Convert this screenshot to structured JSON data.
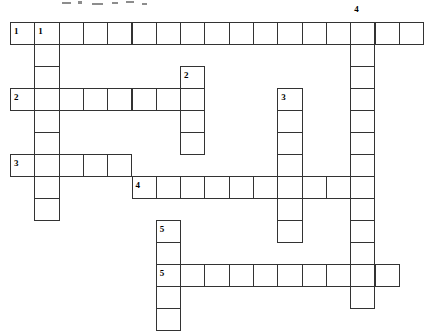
{
  "document": {
    "type": "crossword-puzzle-grid",
    "title": "Crossword Puzzle",
    "background_color": "#ffffff",
    "line_color": "#333333",
    "number_color": "#000000"
  },
  "grid": {
    "origin_x": 10,
    "origin_y": 22,
    "cell_width": 24.3,
    "cell_height": 22,
    "columns": 17,
    "rows": 14,
    "border_width": 1
  },
  "entries": [
    {
      "number": "1",
      "direction": "across",
      "row": 0,
      "col": 0,
      "length": 17,
      "label": "1-across"
    },
    {
      "number": "1",
      "direction": "down",
      "row": 0,
      "col": 1,
      "length": 9,
      "label": "1-down"
    },
    {
      "number": "2",
      "direction": "down",
      "row": 2,
      "col": 7,
      "length": 4,
      "label": "2-down"
    },
    {
      "number": "2",
      "direction": "across",
      "row": 3,
      "col": 0,
      "length": 8,
      "label": "2-across"
    },
    {
      "number": "3",
      "direction": "down",
      "row": 3,
      "col": 11,
      "length": 7,
      "label": "3-down"
    },
    {
      "number": "3",
      "direction": "across",
      "row": 6,
      "col": 0,
      "length": 5,
      "label": "3-across"
    },
    {
      "number": "4",
      "direction": "down",
      "row": 0,
      "col": 14,
      "length": 13,
      "label": "4-down"
    },
    {
      "number": "4",
      "direction": "across",
      "row": 7,
      "col": 5,
      "length": 10,
      "label": "4-across"
    },
    {
      "number": "5",
      "direction": "down",
      "row": 9,
      "col": 6,
      "length": 5,
      "label": "5-down"
    },
    {
      "number": "5",
      "direction": "across",
      "row": 11,
      "col": 6,
      "length": 10,
      "label": "5-across"
    }
  ],
  "numbered_cells": [
    {
      "number": "1",
      "row": 0,
      "col": 0
    },
    {
      "number": "1",
      "row": 0,
      "col": 1
    },
    {
      "number": "4",
      "row": -1,
      "col": 14
    },
    {
      "number": "2",
      "row": 2,
      "col": 7
    },
    {
      "number": "2",
      "row": 3,
      "col": 0
    },
    {
      "number": "3",
      "row": 3,
      "col": 11
    },
    {
      "number": "3",
      "row": 6,
      "col": 0
    },
    {
      "number": "4",
      "row": 7,
      "col": 5
    },
    {
      "number": "5",
      "row": 9,
      "col": 6
    },
    {
      "number": "5",
      "row": 11,
      "col": 6
    }
  ],
  "letters": []
}
